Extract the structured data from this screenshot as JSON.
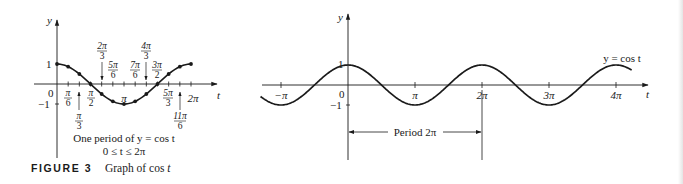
{
  "figure": {
    "label": "FIGURE 3",
    "caption_prefix": "Graph of cos ",
    "caption_var": "t"
  },
  "left_graph": {
    "y_axis_label": "y",
    "x_axis_label": "t",
    "y_ticks": {
      "one": "1",
      "neg_one": "−1",
      "zero": "0"
    },
    "note_line1": "One period of y = cos t",
    "note_line2": "0 ≤ t ≤ 2π",
    "labels": {
      "pi_6": {
        "num": "π",
        "den": "6"
      },
      "pi_3": {
        "num": "π",
        "den": "3"
      },
      "pi_2": {
        "num": "π",
        "den": "2"
      },
      "two_pi_3": {
        "num": "2π",
        "den": "3"
      },
      "five_pi_6": {
        "num": "5π",
        "den": "6"
      },
      "pi": "π",
      "seven_pi_6": {
        "num": "7π",
        "den": "6"
      },
      "four_pi_3": {
        "num": "4π",
        "den": "3"
      },
      "three_pi_2": {
        "num": "3π",
        "den": "2"
      },
      "five_pi_3": {
        "num": "5π",
        "den": "3"
      },
      "eleven_pi_6": {
        "num": "11π",
        "den": "6"
      },
      "two_pi": "2π"
    }
  },
  "right_graph": {
    "y_axis_label": "y",
    "x_axis_label": "t",
    "curve_label": "y = cos t",
    "y_ticks": {
      "one": "1",
      "neg_one": "−1",
      "zero": "0"
    },
    "x_ticks": [
      "−π",
      "π",
      "2π",
      "3π",
      "4π"
    ],
    "period_label": "Period 2π"
  },
  "chart_data": [
    {
      "type": "line",
      "title": "One period of y = cos t",
      "subtitle": "0 ≤ t ≤ 2π",
      "xlabel": "t",
      "ylabel": "y",
      "x": [
        "0",
        "π/6",
        "π/3",
        "π/2",
        "2π/3",
        "5π/6",
        "π",
        "7π/6",
        "4π/3",
        "3π/2",
        "5π/3",
        "11π/6",
        "2π"
      ],
      "series": [
        {
          "name": "cos t",
          "values": [
            1,
            0.866,
            0.5,
            0,
            -0.5,
            -0.866,
            -1,
            -0.866,
            -0.5,
            0,
            0.5,
            0.866,
            1
          ]
        }
      ],
      "ylim": [
        -1,
        1
      ],
      "xlim": [
        0,
        6.2832
      ],
      "markers": true,
      "grid": false,
      "legend": "none"
    },
    {
      "type": "line",
      "title": "y = cos t",
      "xlabel": "t",
      "ylabel": "y",
      "x_tick_labels": [
        "−π",
        "0",
        "π",
        "2π",
        "3π",
        "4π"
      ],
      "y_tick_labels": [
        "−1",
        "0",
        "1"
      ],
      "series": [
        {
          "name": "y = cos t",
          "function": "cos(t)",
          "t_range": [
            -4.1,
            13.3
          ]
        }
      ],
      "ylim": [
        -1,
        1
      ],
      "annotations": [
        {
          "text": "Period 2π",
          "from": 0,
          "to": 6.2832
        }
      ],
      "grid": false,
      "legend": "none"
    }
  ]
}
